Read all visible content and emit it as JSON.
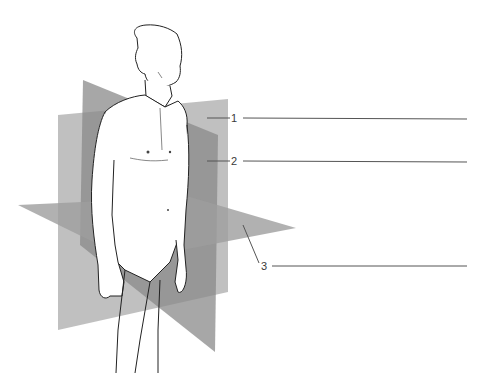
{
  "figure": {
    "colors": {
      "plane_light": "#b9b9b9",
      "plane_mid": "#9a9a9a",
      "plane_dark": "#7a7a7a",
      "line": "#555555",
      "skin": "#ffffff",
      "outline": "#222222"
    }
  },
  "labels": [
    {
      "number": "1",
      "answer": ""
    },
    {
      "number": "2",
      "answer": ""
    },
    {
      "number": "3",
      "answer": ""
    }
  ]
}
